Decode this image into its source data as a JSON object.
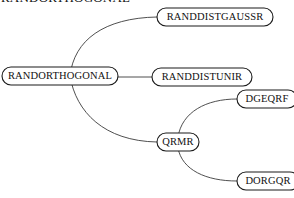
{
  "diagram": {
    "type": "call-graph-tree",
    "background_color": "#ffffff",
    "node_stroke_color": "#1a1a1a",
    "edge_stroke_color": "#3b3b3b",
    "text_color": "#111111",
    "clipped_title": "RANDORTHOGONAL",
    "nodes": [
      {
        "id": "randorthogonal",
        "label": "RANDORTHOGONAL",
        "x": 2,
        "y": 67,
        "width": 116,
        "height": 18,
        "font_size": 10.5,
        "role": "root"
      },
      {
        "id": "randdistgaussr",
        "label": "RANDDISTGAUSSR",
        "x": 157,
        "y": 8,
        "width": 116,
        "height": 18,
        "font_size": 10.5,
        "role": "leaf"
      },
      {
        "id": "randdistunir",
        "label": "RANDDISTUNIR",
        "x": 152,
        "y": 68,
        "width": 100,
        "height": 18,
        "font_size": 10.5,
        "role": "leaf"
      },
      {
        "id": "dgeqrf",
        "label": "DGEQRF",
        "x": 237,
        "y": 90,
        "width": 60,
        "height": 18,
        "font_size": 10.5,
        "role": "leaf"
      },
      {
        "id": "qrmr",
        "label": "QRMR",
        "x": 157,
        "y": 133,
        "width": 42,
        "height": 18,
        "font_size": 10.5,
        "role": "branch"
      },
      {
        "id": "dorgqr",
        "label": "DORGQR",
        "x": 237,
        "y": 172,
        "width": 62,
        "height": 18,
        "font_size": 10.5,
        "role": "leaf"
      }
    ],
    "edges": [
      {
        "id": "edge-randorthogonal-randdistgaussr",
        "from": "randorthogonal",
        "to": "randdistgaussr",
        "shape": "curve",
        "path": "M 70 76 C 74 40, 104 18, 157 17"
      },
      {
        "id": "edge-randorthogonal-randdistunir",
        "from": "randorthogonal",
        "to": "randdistunir",
        "shape": "line",
        "path": "M 118 77 L 152 77"
      },
      {
        "id": "edge-randorthogonal-qrmr",
        "from": "randorthogonal",
        "to": "qrmr",
        "shape": "curve",
        "path": "M 70 76 C 76 112, 104 141, 157 142"
      },
      {
        "id": "edge-qrmr-dgeqrf",
        "from": "qrmr",
        "to": "dgeqrf",
        "shape": "curve",
        "path": "M 178 137 C 182 112, 206 99, 237 99"
      },
      {
        "id": "edge-qrmr-dorgqr",
        "from": "qrmr",
        "to": "dorgqr",
        "shape": "curve",
        "path": "M 178 148 C 182 170, 206 181, 237 181"
      }
    ]
  }
}
